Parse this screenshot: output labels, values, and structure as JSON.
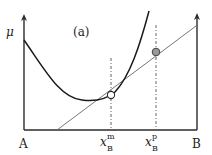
{
  "diagram": {
    "panel_label": "(a)",
    "y_axis_label": "μ",
    "left_endpoint_label": "A",
    "right_endpoint_label": "B",
    "markers": [
      {
        "name": "x_B^m",
        "base": "x",
        "sub": "B",
        "sup": "m",
        "style": "open-circle"
      },
      {
        "name": "x_B^p",
        "base": "x",
        "sub": "B",
        "sup": "p",
        "style": "gray-filled-circle"
      }
    ],
    "elements": {
      "curve": "convex free-energy curve",
      "tangent_line": "straight line tangent at x_B^m",
      "dashed_lines": [
        "x_B^m",
        "x_B^p"
      ]
    },
    "colors": {
      "axes": "#2b2b2b",
      "curve": "#1a1a1a",
      "tangent": "#666666",
      "dashed": "#555555",
      "open_marker_fill": "#ffffff",
      "filled_marker_fill": "#9a9a9a"
    }
  }
}
